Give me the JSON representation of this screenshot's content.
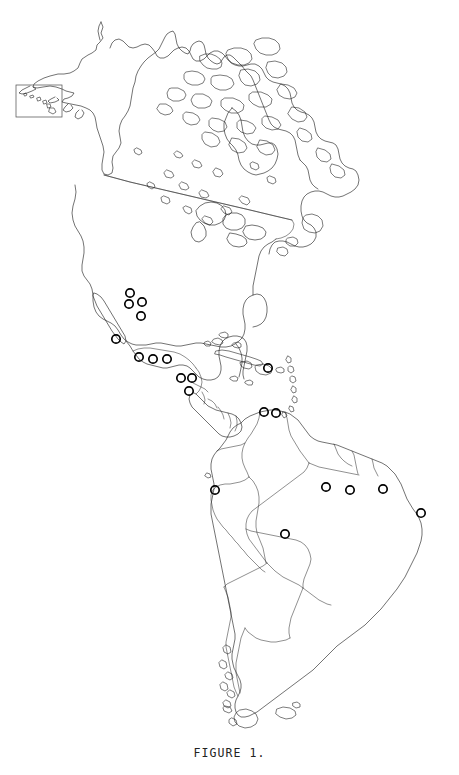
{
  "figure": {
    "caption": "FIGURE 1.",
    "background_color": "#ffffff",
    "outline_color": "#1b1b1b",
    "marker_color": "#000000",
    "width": 459,
    "height": 775
  },
  "inset": {
    "name": "hawaii-inset",
    "frame": {
      "x": 16,
      "y": 85,
      "width": 46,
      "height": 32
    },
    "border_color": "#555555"
  },
  "chart_data": {
    "type": "scatter",
    "title": "FIGURE 1.",
    "subtitle": "",
    "xlabel": "",
    "ylabel": "",
    "projection": "Americas outline map",
    "grid": false,
    "legend": "none",
    "xlim": [
      0,
      459
    ],
    "ylim": [
      0,
      742
    ],
    "marker_style": "open circle",
    "marker_radius": 4.2,
    "series": [
      {
        "name": "collection-localities",
        "count": 23,
        "points": [
          {
            "id": 1,
            "x": 130,
            "y": 293,
            "region": "northern Mexico / Texas borderland"
          },
          {
            "id": 2,
            "x": 129,
            "y": 304,
            "region": "northern Mexico"
          },
          {
            "id": 3,
            "x": 142,
            "y": 302,
            "region": "northern Mexico"
          },
          {
            "id": 4,
            "x": 141,
            "y": 316,
            "region": "northeastern Mexico"
          },
          {
            "id": 5,
            "x": 116,
            "y": 339,
            "region": "western Mexico / Pacific coast"
          },
          {
            "id": 6,
            "x": 139,
            "y": 357,
            "region": "southern Mexico"
          },
          {
            "id": 7,
            "x": 153,
            "y": 359,
            "region": "southern Mexico / Oaxaca"
          },
          {
            "id": 8,
            "x": 167,
            "y": 359,
            "region": "Chiapas / Tabasco"
          },
          {
            "id": 9,
            "x": 181,
            "y": 378,
            "region": "Guatemala / Honduras"
          },
          {
            "id": 10,
            "x": 192,
            "y": 378,
            "region": "Honduras"
          },
          {
            "id": 11,
            "x": 189,
            "y": 391,
            "region": "Nicaragua / El Salvador"
          },
          {
            "id": 12,
            "x": 268,
            "y": 368,
            "region": "Puerto Rico / Lesser Antilles"
          },
          {
            "id": 13,
            "x": 264,
            "y": 412,
            "region": "northern Venezuela"
          },
          {
            "id": 14,
            "x": 276,
            "y": 413,
            "region": "northern Venezuela"
          },
          {
            "id": 15,
            "x": 215,
            "y": 490,
            "region": "Peru"
          },
          {
            "id": 16,
            "x": 326,
            "y": 487,
            "region": "northeastern Brazil / Pará"
          },
          {
            "id": 17,
            "x": 350,
            "y": 490,
            "region": "northeastern Brazil / Maranhão"
          },
          {
            "id": 18,
            "x": 383,
            "y": 489,
            "region": "northeastern Brazil / Ceará"
          },
          {
            "id": 19,
            "x": 421,
            "y": 513,
            "region": "eastern Brazil / Pernambuco"
          },
          {
            "id": 20,
            "x": 285,
            "y": 534,
            "region": "Bolivia"
          }
        ]
      }
    ],
    "annotations": [
      {
        "text": "FIGURE 1.",
        "x": 229,
        "y": 755,
        "align": "center"
      }
    ]
  }
}
